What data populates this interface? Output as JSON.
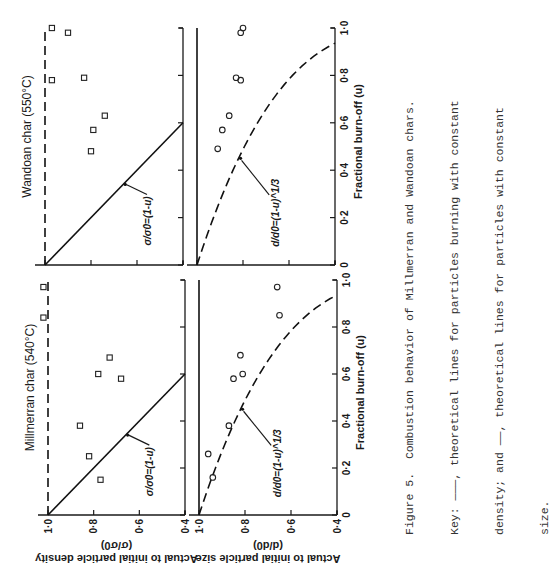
{
  "figure": {
    "caption_lines": [
      "Figure 5.  Combustion behavior of Millmerran and Wandoan chars.",
      "Key: ———, theoretical lines for particles burning with constant",
      "density; and ——, theoretical lines for particles with constant",
      "size."
    ]
  },
  "chart_data": [
    {
      "type": "scatter",
      "panel": "top-left",
      "title": "Millmerran char (540°C)",
      "xlabel": "",
      "ylabel": "Actual to initial particle density",
      "ylabel2": "(σ/σ0)",
      "xlim": [
        0,
        1.0
      ],
      "ylim": [
        0.4,
        1.0
      ],
      "yticks": [
        "1·0",
        "0·8",
        "0·6",
        "0·4"
      ],
      "marker": "square",
      "points": [
        {
          "u": 0.15,
          "v": 0.77
        },
        {
          "u": 0.25,
          "v": 0.82
        },
        {
          "u": 0.38,
          "v": 0.86
        },
        {
          "u": 0.58,
          "v": 0.68
        },
        {
          "u": 0.6,
          "v": 0.78
        },
        {
          "u": 0.67,
          "v": 0.73
        },
        {
          "u": 0.84,
          "v": 1.02
        },
        {
          "u": 0.97,
          "v": 1.02
        }
      ],
      "theory": [
        {
          "name": "constant density",
          "style": "dashed",
          "equation": "σ/σ0 = 1",
          "points": [
            [
              0,
              1.0
            ],
            [
              1.0,
              1.0
            ]
          ]
        },
        {
          "name": "constant size",
          "style": "solid",
          "equation": "σ/σ0=(1-u)",
          "points": [
            [
              0,
              1.0
            ],
            [
              0.6,
              0.4
            ]
          ]
        }
      ],
      "annotation": "σ/σ0=(1-u)"
    },
    {
      "type": "scatter",
      "panel": "top-right",
      "title": "Wandoan char (550°C)",
      "xlabel": "",
      "ylabel": "",
      "xlim": [
        0,
        1.0
      ],
      "ylim": [
        0.4,
        1.0
      ],
      "marker": "square",
      "points": [
        {
          "u": 0.48,
          "v": 0.8
        },
        {
          "u": 0.57,
          "v": 0.79
        },
        {
          "u": 0.63,
          "v": 0.74
        },
        {
          "u": 0.78,
          "v": 0.97
        },
        {
          "u": 0.79,
          "v": 0.83
        },
        {
          "u": 0.98,
          "v": 0.9
        },
        {
          "u": 1.0,
          "v": 0.97
        }
      ],
      "theory": [
        {
          "name": "constant density",
          "style": "dashed",
          "equation": "σ/σ0 = 1",
          "points": [
            [
              0,
              1.0
            ],
            [
              1.0,
              1.0
            ]
          ]
        },
        {
          "name": "constant size",
          "style": "solid",
          "equation": "σ/σ0=(1-u)",
          "points": [
            [
              0,
              1.0
            ],
            [
              0.6,
              0.4
            ]
          ]
        }
      ],
      "annotation": "σ/σ0=(1-u)"
    },
    {
      "type": "scatter",
      "panel": "bottom-left",
      "title": "",
      "xlabel": "Fractional burn-off (u)",
      "ylabel": "Actual to initial particle size",
      "ylabel2": "(d/d0)",
      "xlim": [
        0,
        1.0
      ],
      "ylim": [
        0.4,
        1.0
      ],
      "xticks": [
        "0",
        "0·2",
        "0·4",
        "0·6",
        "0·8",
        "1·0"
      ],
      "yticks": [
        "1·0",
        "0·8",
        "0·6",
        "0·4"
      ],
      "marker": "circle",
      "points": [
        {
          "u": 0.16,
          "v": 0.94
        },
        {
          "u": 0.26,
          "v": 0.96
        },
        {
          "u": 0.38,
          "v": 0.87
        },
        {
          "u": 0.58,
          "v": 0.85
        },
        {
          "u": 0.6,
          "v": 0.81
        },
        {
          "u": 0.68,
          "v": 0.82
        },
        {
          "u": 0.85,
          "v": 0.65
        },
        {
          "u": 0.97,
          "v": 0.66
        }
      ],
      "theory": [
        {
          "name": "constant density",
          "style": "dashed",
          "equation": "d/d0=(1-u)^1/3"
        },
        {
          "name": "constant size",
          "style": "solid",
          "equation": "d/d0 = 1",
          "points": [
            [
              0,
              1.0
            ],
            [
              1.0,
              1.0
            ]
          ]
        }
      ],
      "annotation": "d/d0=(1-u)^1/3"
    },
    {
      "type": "scatter",
      "panel": "bottom-right",
      "title": "",
      "xlabel": "Fractional burn-off (u)",
      "ylabel": "",
      "xlim": [
        0,
        1.0
      ],
      "ylim": [
        0.4,
        1.0
      ],
      "xticks": [
        "0",
        "0·2",
        "0·4",
        "0·6",
        "0·8",
        "1·0"
      ],
      "marker": "circle",
      "points": [
        {
          "u": 0.49,
          "v": 0.91
        },
        {
          "u": 0.57,
          "v": 0.89
        },
        {
          "u": 0.63,
          "v": 0.86
        },
        {
          "u": 0.78,
          "v": 0.81
        },
        {
          "u": 0.79,
          "v": 0.83
        },
        {
          "u": 0.98,
          "v": 0.81
        },
        {
          "u": 1.0,
          "v": 0.8
        }
      ],
      "theory": [
        {
          "name": "constant density",
          "style": "dashed",
          "equation": "d/d0=(1-u)^1/3"
        },
        {
          "name": "constant size",
          "style": "solid",
          "equation": "d/d0 = 1",
          "points": [
            [
              0,
              1.0
            ],
            [
              1.0,
              1.0
            ]
          ]
        }
      ],
      "annotation": "d/d0=(1-u)^1/3"
    }
  ]
}
